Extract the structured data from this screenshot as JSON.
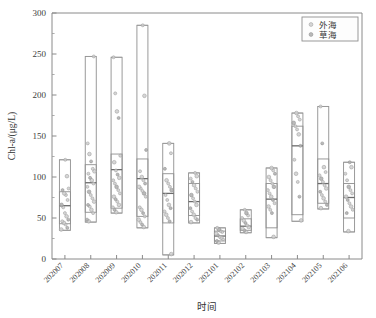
{
  "chart_data": {
    "type": "box",
    "title": "",
    "xlabel": "时间",
    "ylabel": "Chl-a/(μg/L)",
    "ylim": [
      0,
      300
    ],
    "ytick_step": 50,
    "ytick_labels": [
      "0",
      "50",
      "100",
      "150",
      "200",
      "250",
      "300"
    ],
    "yticks": [
      0,
      50,
      100,
      150,
      200,
      250,
      300
    ],
    "minor_ticks": true,
    "grid": false,
    "legend_position": "top-right",
    "categories": [
      "202007",
      "202008",
      "202009",
      "202010",
      "202011",
      "202012",
      "202101",
      "202102",
      "202103",
      "202104",
      "202105",
      "202106"
    ],
    "legend": [
      {
        "name": "外海",
        "marker": "open-circle",
        "color": "#cfcfcf"
      },
      {
        "name": "草海",
        "marker": "filled-circle",
        "color": "#b3b3b3"
      }
    ],
    "boxes": [
      {
        "category": "202007",
        "min": 35,
        "q1": 43,
        "median": 65,
        "q3": 82,
        "max": 121,
        "points": [
          36,
          38,
          42,
          44,
          46,
          48,
          52,
          56,
          63,
          66,
          72,
          78,
          80,
          84,
          86,
          101,
          121
        ]
      },
      {
        "category": "202008",
        "min": 45,
        "q1": 57,
        "median": 93,
        "q3": 115,
        "max": 247,
        "points": [
          46,
          48,
          56,
          60,
          64,
          66,
          70,
          74,
          78,
          82,
          88,
          92,
          96,
          99,
          104,
          107,
          110,
          119,
          128,
          141,
          247
        ]
      },
      {
        "category": "202009",
        "min": 56,
        "q1": 62,
        "median": 109,
        "q3": 128,
        "max": 246,
        "points": [
          57,
          60,
          63,
          66,
          70,
          73,
          76,
          80,
          84,
          88,
          92,
          96,
          99,
          103,
          108,
          118,
          126,
          172,
          180,
          202,
          246
        ]
      },
      {
        "category": "202010",
        "min": 38,
        "q1": 52,
        "median": 98,
        "q3": 122,
        "max": 285,
        "points": [
          39,
          42,
          45,
          48,
          52,
          56,
          60,
          63,
          76,
          80,
          83,
          86,
          88,
          92,
          96,
          100,
          107,
          133,
          199,
          285
        ]
      },
      {
        "category": "202011",
        "min": 5,
        "q1": 44,
        "median": 80,
        "q3": 104,
        "max": 141,
        "points": [
          6,
          46,
          50,
          54,
          58,
          62,
          66,
          72,
          78,
          84,
          88,
          92,
          96,
          110,
          129,
          141
        ]
      },
      {
        "category": "202012",
        "min": 44,
        "q1": 53,
        "median": 70,
        "q3": 92,
        "max": 105,
        "points": [
          45,
          48,
          50,
          54,
          58,
          62,
          66,
          70,
          74,
          78,
          82,
          86,
          90,
          94,
          98,
          101,
          105
        ]
      },
      {
        "category": "202101",
        "min": 19,
        "q1": 22,
        "median": 28,
        "q3": 34,
        "max": 38,
        "points": [
          20,
          22,
          24,
          26,
          27,
          29,
          31,
          33,
          34,
          36,
          38
        ]
      },
      {
        "category": "202102",
        "min": 32,
        "q1": 35,
        "median": 40,
        "q3": 49,
        "max": 60,
        "points": [
          33,
          35,
          37,
          39,
          41,
          44,
          47,
          50,
          53,
          56,
          60
        ]
      },
      {
        "category": "202103",
        "min": 26,
        "q1": 38,
        "median": 73,
        "q3": 92,
        "max": 111,
        "points": [
          27,
          56,
          60,
          64,
          68,
          72,
          76,
          80,
          84,
          88,
          92,
          96,
          100,
          104,
          108,
          111
        ]
      },
      {
        "category": "202104",
        "min": 46,
        "q1": 54,
        "median": 138,
        "q3": 162,
        "max": 178,
        "points": [
          47,
          76,
          94,
          104,
          121,
          138,
          152,
          158,
          162,
          166,
          170,
          174,
          178
        ]
      },
      {
        "category": "202105",
        "min": 61,
        "q1": 68,
        "median": 92,
        "q3": 122,
        "max": 186,
        "points": [
          62,
          66,
          70,
          74,
          78,
          82,
          86,
          90,
          94,
          98,
          102,
          106,
          112,
          141,
          186
        ]
      },
      {
        "category": "202106",
        "min": 33,
        "q1": 50,
        "median": 75,
        "q3": 92,
        "max": 118,
        "points": [
          34,
          56,
          60,
          64,
          68,
          72,
          76,
          80,
          84,
          88,
          96,
          104,
          112,
          118
        ]
      }
    ]
  },
  "axes": {
    "x_title": "时间",
    "y_title": "Chl-a/(μg/L)"
  },
  "legend": {
    "item1": "外海",
    "item2": "草海"
  }
}
